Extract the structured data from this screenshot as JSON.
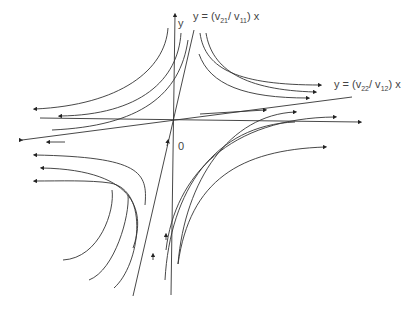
{
  "figure": {
    "type": "phase-portrait-saddle",
    "labels": {
      "y_axis": "y",
      "origin": "0",
      "eigenline_1": {
        "prefix": "y = (v",
        "sub1": "21",
        "mid": "/ v",
        "sub2": "11",
        "suffix": ") x"
      },
      "eigenline_2": {
        "prefix": "y = (v",
        "sub1": "22",
        "mid": "/ v",
        "sub2": "12",
        "suffix": ") x"
      }
    },
    "colors": {
      "stroke": "#333333",
      "text": "#444444",
      "background": "#ffffff"
    }
  }
}
